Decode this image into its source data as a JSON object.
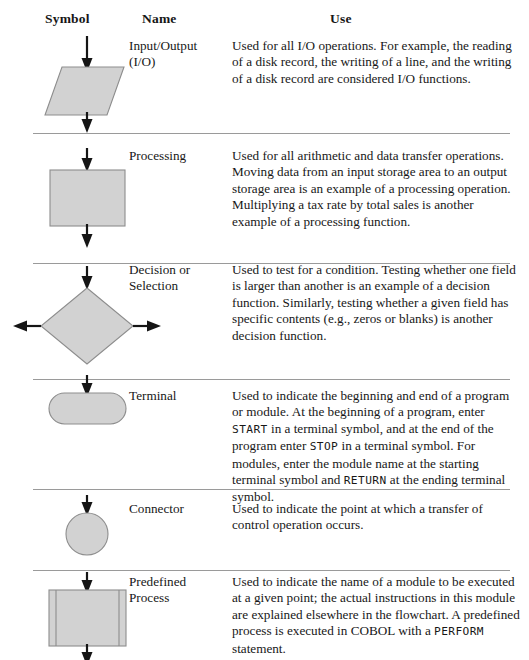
{
  "table": {
    "headers": {
      "symbol": "Symbol",
      "name": "Name",
      "use": "Use"
    },
    "rows": [
      {
        "symbol_shape": "parallelogram",
        "name_line1": "Input/Output",
        "name_line2": "(I/O)",
        "use": "Used for all I/O operations. For example, the reading of a disk record, the writing of a line, and the writing of a disk record are considered I/O functions."
      },
      {
        "symbol_shape": "rectangle",
        "name_line1": "Processing",
        "name_line2": "",
        "use": "Used for all arithmetic and data transfer operations. Moving data from an input storage area to an output storage area is an example of a processing operation. Multiplying a tax rate by total sales is another example of a processing function."
      },
      {
        "symbol_shape": "diamond",
        "name_line1": "Decision or",
        "name_line2": "Selection",
        "use": "Used to test for a condition. Testing whether one field is larger than another is an example of a decision function. Similarly, testing whether a given field has specific contents (e.g., zeros or blanks) is another decision function."
      },
      {
        "symbol_shape": "stadium",
        "name_line1": "Terminal",
        "name_line2": "",
        "use_parts": [
          {
            "text": "Used to indicate the beginning and end of a program or module. At the beginning of a program, enter ",
            "code": false
          },
          {
            "text": "START",
            "code": true
          },
          {
            "text": " in a terminal symbol, and at the end of the program enter ",
            "code": false
          },
          {
            "text": "STOP",
            "code": true
          },
          {
            "text": " in a terminal symbol. For modules, enter the module name at the starting terminal symbol and ",
            "code": false
          },
          {
            "text": "RETURN",
            "code": true
          },
          {
            "text": " at the ending terminal symbol.",
            "code": false
          }
        ]
      },
      {
        "symbol_shape": "circle",
        "name_line1": "Connector",
        "name_line2": "",
        "use": "Used to indicate the point at which a transfer of control operation occurs."
      },
      {
        "symbol_shape": "predefined-process",
        "name_line1": "Predefined",
        "name_line2": "Process",
        "use_parts": [
          {
            "text": "Used to indicate the name of a module to be executed at a given point; the actual instructions in this module are explained elsewhere in the flowchart. A predefined process is executed in COBOL with a ",
            "code": false
          },
          {
            "text": "PERFORM",
            "code": true
          },
          {
            "text": " statement.",
            "code": false
          }
        ]
      }
    ]
  },
  "colors": {
    "symbol_fill": "#d2d2d2",
    "symbol_stroke": "#8d8d8d",
    "flowline": "#151515",
    "rule": "#9a9a9a",
    "text": "#171717"
  }
}
